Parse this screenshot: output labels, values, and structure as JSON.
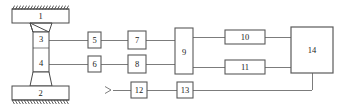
{
  "diagram": {
    "style": {
      "line_color": "#6e6e6e",
      "box_stroke": "#5a5a5a",
      "box_fill": "#ffffff",
      "text_color": "#1a1a1a",
      "hatch_color": "#4a4a4a",
      "background": "#ffffff"
    },
    "blocks": [
      {
        "id": "b1",
        "label": "1",
        "shape": "plate-top",
        "x": 12,
        "y": 9,
        "w": 57,
        "h": 14
      },
      {
        "id": "b2",
        "label": "2",
        "shape": "plate-bottom",
        "x": 12,
        "y": 86,
        "w": 57,
        "h": 14
      },
      {
        "id": "b3",
        "label": "3",
        "shape": "gauge-upper",
        "x": 33,
        "y": 32,
        "w": 16,
        "h": 16
      },
      {
        "id": "b4",
        "label": "4",
        "shape": "gauge-lower",
        "x": 33,
        "y": 56,
        "w": 16,
        "h": 16
      },
      {
        "id": "b5",
        "label": "5",
        "shape": "rect",
        "x": 88,
        "y": 32,
        "w": 13,
        "h": 16
      },
      {
        "id": "b6",
        "label": "6",
        "shape": "rect",
        "x": 88,
        "y": 56,
        "w": 13,
        "h": 16
      },
      {
        "id": "b7",
        "label": "7",
        "shape": "rect",
        "x": 128,
        "y": 31,
        "w": 18,
        "h": 18
      },
      {
        "id": "b8",
        "label": "8",
        "shape": "rect",
        "x": 128,
        "y": 55,
        "w": 18,
        "h": 18
      },
      {
        "id": "b9",
        "label": "9",
        "shape": "rect",
        "x": 175,
        "y": 28,
        "w": 18,
        "h": 46
      },
      {
        "id": "b10",
        "label": "10",
        "shape": "rect",
        "x": 225,
        "y": 30,
        "w": 40,
        "h": 14
      },
      {
        "id": "b11",
        "label": "11",
        "shape": "rect",
        "x": 225,
        "y": 60,
        "w": 40,
        "h": 14
      },
      {
        "id": "b12",
        "label": "12",
        "shape": "rect",
        "x": 131,
        "y": 82,
        "w": 16,
        "h": 16
      },
      {
        "id": "b13",
        "label": "13",
        "shape": "rect",
        "x": 177,
        "y": 82,
        "w": 16,
        "h": 16
      },
      {
        "id": "b14",
        "label": "14",
        "shape": "rect",
        "x": 291,
        "y": 27,
        "w": 42,
        "h": 46
      }
    ],
    "input_arrow": {
      "name": "input-arrow",
      "x": 108,
      "y": 90
    },
    "connections": [
      {
        "from": "b3",
        "to": "b5"
      },
      {
        "from": "b5",
        "to": "b7"
      },
      {
        "from": "b7",
        "to": "b9"
      },
      {
        "from": "b4",
        "to": "b6"
      },
      {
        "from": "b6",
        "to": "b8"
      },
      {
        "from": "b8",
        "to": "b9"
      },
      {
        "from": "b9",
        "to": "b10"
      },
      {
        "from": "b9",
        "to": "b11"
      },
      {
        "from": "b10",
        "to": "b14"
      },
      {
        "from": "b11",
        "to": "b14"
      },
      {
        "from": "input-arrow",
        "to": "b12"
      },
      {
        "from": "b12",
        "to": "b13"
      },
      {
        "from": "b13",
        "to": "b14"
      }
    ]
  }
}
